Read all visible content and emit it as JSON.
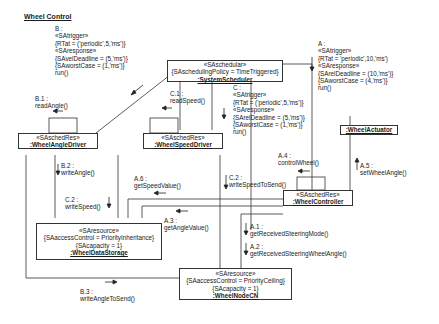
{
  "diagram": {
    "title": "Wheel Control",
    "objects": {
      "scheduler": {
        "stereotype": "«SAschedular»",
        "attr1": "{SAschedulingPolicy = TimeTriggered}",
        "name": ":SystemScheduler"
      },
      "angle_driver": {
        "stereotype": "«SAschedRes»",
        "name": ":WheelAngleDriver"
      },
      "speed_driver": {
        "stereotype": "«SAschedRes»",
        "name": ":WheelSpeedDriver"
      },
      "actuator": {
        "name": ":WheelActuator"
      },
      "controller": {
        "stereotype": "«SAschedRes»",
        "name": ":WheelController"
      },
      "data_storage": {
        "stereotype": "«SAresource»",
        "attr1": "{SAaccessControl = PriorityInheritance}",
        "attr2": "{SAcapacity = 1}",
        "name": ":WheelDataStorage"
      },
      "node_cn": {
        "stereotype": "«SAresource»",
        "attr1": "{SAaccessControl = PriorityCeiling}",
        "attr2": "{SAcapacity = 1}",
        "name": ":WheelNodeCN"
      }
    },
    "triggers": {
      "B": {
        "id": "B :",
        "l1": "«SAtrigger»",
        "l2": "{RTat = ('periodic',5,'ms')}",
        "l3": "«SAresponse»",
        "l4": "{SAvelDeadline = (5,'ms')}",
        "l5": "{SAworstCase = (1,'ms')}",
        "l6": "run()"
      },
      "C": {
        "id": "C :",
        "l1": "«SAtrigger»",
        "l2": "{RTat = ('periodic',5,'ms')}",
        "l3": "«SAresponse»",
        "l4": "{SArelDeadline = (5,'ms')}",
        "l5": "{SAworstCase = (1,'ms')}",
        "l6": "run()"
      },
      "A": {
        "id": "A :",
        "l1": "«SAtrigger»",
        "l2": "{RTat = 'periodic',10,'ms')",
        "l3": "«SAresponse»",
        "l4": "{SArelDeadline = (10,'ms')}",
        "l5": "{SAworstCase = (4,'ms')}",
        "l6": "run()"
      }
    },
    "messages": {
      "B1": {
        "id": "B.1 :",
        "op": "readAngle()"
      },
      "C1": {
        "id": "C.1 :",
        "op": "readSpeed()"
      },
      "B2": {
        "id": "B.2 :",
        "op": "writeAngle()"
      },
      "C2a": {
        "id": "C.2 :",
        "op": "writeSpeed()"
      },
      "A6": {
        "id": "A.6 :",
        "op": "getSpeedValue()"
      },
      "C2b": {
        "id": "C.2 :",
        "op": "writeSpeedToSend()"
      },
      "A4": {
        "id": "A.4 :",
        "op": "controlWheel()"
      },
      "A5": {
        "id": "A.5 :",
        "op": "setWheelAngle()"
      },
      "A3": {
        "id": "A.3 :",
        "op": "getAngleValue()"
      },
      "A1": {
        "id": "A.1 :",
        "op": "getReceivedSteeringMode()"
      },
      "A2": {
        "id": "A.2 :",
        "op": "getReceivedSteeringWheelAngle()"
      },
      "B3": {
        "id": "B.3 :",
        "op": "writeAngleToSend()"
      }
    }
  }
}
